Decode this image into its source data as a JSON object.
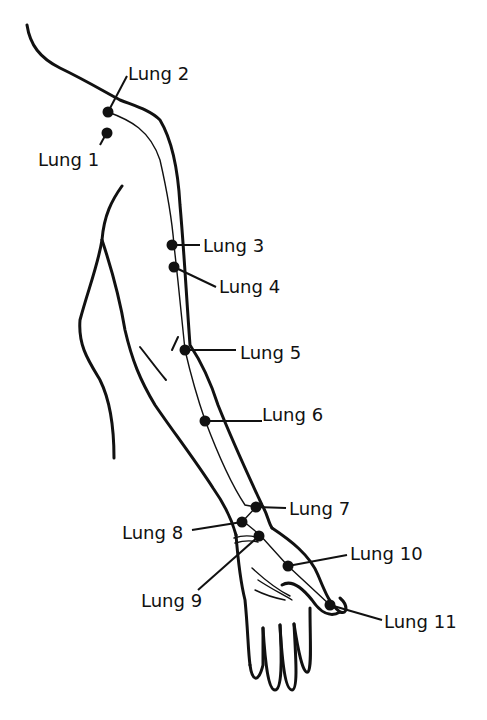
{
  "colors": {
    "line": "#111111",
    "background": "#ffffff"
  },
  "points": [
    {
      "id": "lung-1",
      "label": "Lung 1"
    },
    {
      "id": "lung-2",
      "label": "Lung 2"
    },
    {
      "id": "lung-3",
      "label": "Lung 3"
    },
    {
      "id": "lung-4",
      "label": "Lung 4"
    },
    {
      "id": "lung-5",
      "label": "Lung 5"
    },
    {
      "id": "lung-6",
      "label": "Lung 6"
    },
    {
      "id": "lung-7",
      "label": "Lung 7"
    },
    {
      "id": "lung-8",
      "label": "Lung 8"
    },
    {
      "id": "lung-9",
      "label": "Lung 9"
    },
    {
      "id": "lung-10",
      "label": "Lung 10"
    },
    {
      "id": "lung-11",
      "label": "Lung 11"
    }
  ]
}
